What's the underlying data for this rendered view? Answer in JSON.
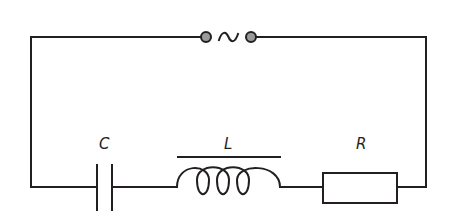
{
  "diagram": {
    "type": "series RLC circuit",
    "source": {
      "symbol": "~",
      "label": "AC source",
      "terminal_color": "#9a9a9a"
    },
    "components": [
      {
        "id": "C",
        "label": "C",
        "kind": "capacitor"
      },
      {
        "id": "L",
        "label": "L",
        "kind": "inductor"
      },
      {
        "id": "R",
        "label": "R",
        "kind": "resistor"
      }
    ],
    "colors": {
      "line": "#231f20",
      "background": "#ffffff"
    }
  }
}
